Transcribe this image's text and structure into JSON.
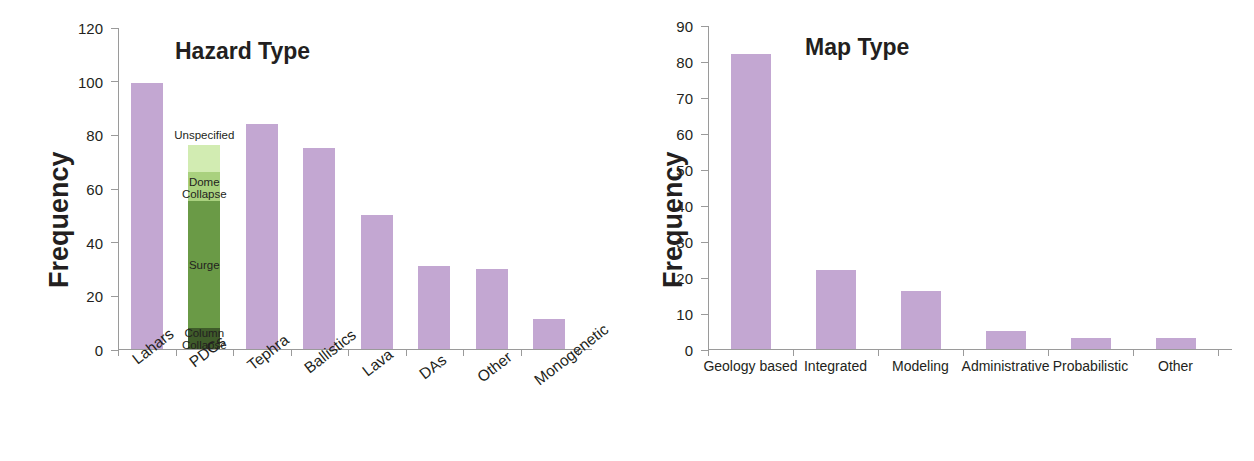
{
  "figure": {
    "background": "#ffffff",
    "bar_color": "#c3a7d2"
  },
  "charts": [
    {
      "id": "hazard-type",
      "title": "Hazard Type",
      "ylabel": "Frequency"
    },
    {
      "id": "map-type",
      "title": "Map Type",
      "ylabel": "Frequency"
    }
  ],
  "chart_data": [
    {
      "type": "bar",
      "title": "Hazard Type",
      "xlabel": "",
      "ylabel": "Frequency",
      "ylim": [
        0,
        120
      ],
      "ytick_labels": [
        "0",
        "20",
        "40",
        "60",
        "80",
        "100",
        "120"
      ],
      "ytick_values": [
        0,
        20,
        40,
        60,
        80,
        100,
        120
      ],
      "grid": false,
      "legend": "none",
      "bar_color": "#c3a7d2",
      "categories": [
        "Lahars",
        "PDCs",
        "Tephra",
        "Ballistics",
        "Lava",
        "DAs",
        "Other",
        "Monogenetic"
      ],
      "values": [
        99,
        76,
        84,
        75,
        50,
        31,
        30,
        11
      ],
      "stacked_bar": {
        "category": "PDCs",
        "total": 76,
        "segments": [
          {
            "label": "Column Collapse",
            "value": 8,
            "color": "#3f5c2a"
          },
          {
            "label": "Surge",
            "value": 47,
            "color": "#6a9a46"
          },
          {
            "label": "Dome Collapse",
            "value": 11,
            "color": "#a9d17e"
          },
          {
            "label": "Unspecified",
            "value": 10,
            "color": "#d2ecb2"
          }
        ]
      }
    },
    {
      "type": "bar",
      "title": "Map Type",
      "xlabel": "",
      "ylabel": "Frequency",
      "ylim": [
        0,
        90
      ],
      "ytick_labels": [
        "0",
        "10",
        "20",
        "30",
        "40",
        "50",
        "60",
        "70",
        "80",
        "90"
      ],
      "ytick_values": [
        0,
        10,
        20,
        30,
        40,
        50,
        60,
        70,
        80,
        90
      ],
      "grid": false,
      "legend": "none",
      "bar_color": "#c3a7d2",
      "categories": [
        "Geology based",
        "Integrated",
        "Modeling",
        "Administrative",
        "Probabilistic",
        "Other"
      ],
      "values": [
        82,
        22,
        16,
        5,
        3,
        3
      ]
    }
  ]
}
